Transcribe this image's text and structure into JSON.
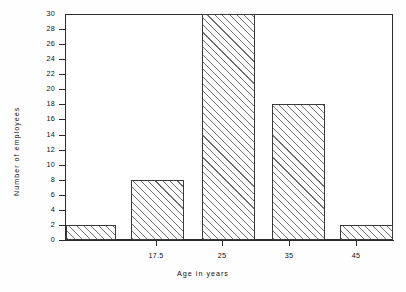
{
  "chart_data": {
    "type": "bar",
    "title": "",
    "subtitle": "",
    "xlabel": "Age in years",
    "ylabel": "Number of employees",
    "categories": [
      "17.5",
      "25",
      "35",
      "45",
      "55"
    ],
    "values": [
      2,
      8,
      30,
      18,
      2
    ],
    "ylim": [
      0,
      30
    ],
    "y_ticks": [
      0,
      2,
      4,
      6,
      8,
      10,
      12,
      14,
      16,
      18,
      20,
      22,
      24,
      26,
      28,
      30
    ],
    "y_tick_labels": [
      "0",
      "2",
      "4",
      "6",
      "8",
      "10",
      "12",
      "14",
      "16",
      "18",
      "20",
      "22",
      "24",
      "26",
      "28",
      "30"
    ],
    "x_tick_labels": [
      "17.5",
      "25",
      "35",
      "45",
      "55"
    ],
    "grid": false,
    "legend": null,
    "legend_position": "none",
    "annotations": [],
    "style": {
      "bar_fill": "#ffffff",
      "bar_hatch": "forward-diagonal",
      "bar_edge_color": "#3a3a3a",
      "hatch_color": "#6f6f6f",
      "axis_color": "#2b2b2b",
      "text_color": "#101010",
      "background": "#fefefe"
    }
  },
  "layout": {
    "bars_px": [
      {
        "left": 1,
        "width": 50,
        "value": 2
      },
      {
        "left": 66,
        "width": 53,
        "value": 8
      },
      {
        "left": 137,
        "width": 53,
        "value": 30
      },
      {
        "left": 207,
        "width": 53,
        "value": 18
      },
      {
        "left": 275,
        "width": 53,
        "value": 2
      }
    ],
    "x_tick_px": [
      91,
      157,
      224,
      291,
      357
    ],
    "x_label_px": [
      91,
      157,
      224,
      291,
      357
    ]
  }
}
